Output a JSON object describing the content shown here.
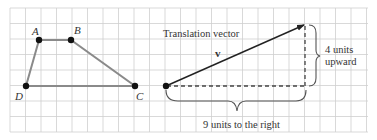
{
  "colors": {
    "grid": "#cfcfcf",
    "polygon_edge": "#888888",
    "point": "#111111",
    "vector": "#222222",
    "dashed": "#444444",
    "brace": "#555555",
    "text": "#333333"
  },
  "quadrilateral": {
    "points": [
      {
        "label": "A",
        "x": 39,
        "y": 40
      },
      {
        "label": "B",
        "x": 71,
        "y": 40
      },
      {
        "label": "C",
        "x": 135,
        "y": 86
      },
      {
        "label": "D",
        "x": 26,
        "y": 86
      }
    ]
  },
  "vector": {
    "title": "Translation vector",
    "name": "v",
    "horizontal_label": "9 units to the right",
    "vertical_label_line1": "4 units",
    "vertical_label_line2": "upward",
    "horizontal_units": 9,
    "vertical_units": 4
  }
}
